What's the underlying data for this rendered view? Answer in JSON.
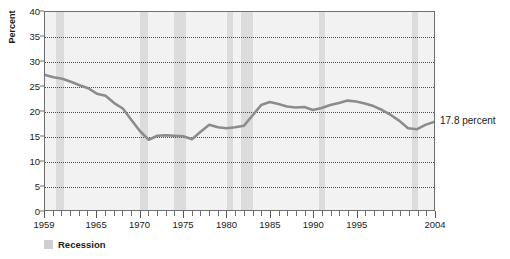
{
  "chart_data": {
    "type": "line",
    "title": "",
    "xlabel": "",
    "ylabel": "Percent",
    "ylim": [
      0,
      40
    ],
    "xlim": [
      1959,
      2004
    ],
    "yticks": [
      0,
      5,
      10,
      15,
      20,
      25,
      30,
      35,
      40
    ],
    "ytick_labels": [
      "0",
      "5",
      "10",
      "15",
      "20",
      "25",
      "30",
      "35",
      "40"
    ],
    "xtick_labels": [
      "1959",
      "1965",
      "1970",
      "1975",
      "1980",
      "1985",
      "1990",
      "1995",
      "2004"
    ],
    "xtick_values": [
      1959,
      1965,
      1970,
      1975,
      1980,
      1985,
      1990,
      1995,
      2004
    ],
    "grid": "horizontal-dotted",
    "legend_position": "below-left",
    "series": [
      {
        "name": "Percent",
        "color": "#8c8c8c",
        "x": [
          1959,
          1960,
          1961,
          1962,
          1963,
          1964,
          1965,
          1966,
          1967,
          1968,
          1969,
          1970,
          1971,
          1972,
          1973,
          1974,
          1975,
          1976,
          1977,
          1978,
          1979,
          1980,
          1981,
          1982,
          1983,
          1984,
          1985,
          1986,
          1987,
          1988,
          1989,
          1990,
          1991,
          1992,
          1993,
          1994,
          1995,
          1996,
          1997,
          1998,
          1999,
          2000,
          2001,
          2002,
          2003,
          2004
        ],
        "values": [
          27.3,
          26.8,
          26.5,
          25.9,
          25.2,
          24.6,
          23.5,
          23.1,
          21.6,
          20.5,
          18.2,
          15.9,
          14.2,
          15.0,
          15.1,
          15.0,
          14.9,
          14.3,
          15.8,
          17.2,
          16.7,
          16.5,
          16.7,
          17.0,
          19.1,
          21.2,
          21.8,
          21.4,
          20.9,
          20.7,
          20.8,
          20.2,
          20.6,
          21.2,
          21.6,
          22.1,
          21.9,
          21.5,
          21.0,
          20.2,
          19.2,
          18.0,
          16.5,
          16.3,
          17.2,
          17.8
        ]
      }
    ],
    "annotation": {
      "text": "17.8 percent",
      "at_x": 2004,
      "at_y": 17.8
    },
    "legend": [
      {
        "label": "Recession",
        "color": "#cfcfcf"
      }
    ],
    "recessions": [
      {
        "start": 1960.3,
        "end": 1961.2
      },
      {
        "start": 1969.9,
        "end": 1970.9
      },
      {
        "start": 1973.9,
        "end": 1975.2
      },
      {
        "start": 1980.0,
        "end": 1980.6
      },
      {
        "start": 1981.5,
        "end": 1982.9
      },
      {
        "start": 1990.5,
        "end": 1991.2
      },
      {
        "start": 2001.2,
        "end": 2001.9
      }
    ]
  }
}
